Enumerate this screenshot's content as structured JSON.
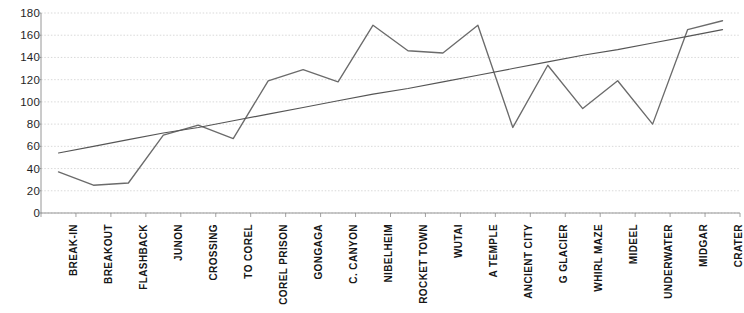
{
  "chart_data": {
    "type": "line",
    "title": "",
    "xlabel": "",
    "ylabel": "",
    "ylim": [
      0,
      180
    ],
    "ytick_step": 20,
    "yticks": [
      180,
      160,
      140,
      120,
      100,
      80,
      60,
      40,
      20,
      0
    ],
    "grid": true,
    "legend": null,
    "categories": [
      "BREAK-IN",
      "BREAKOUT",
      "FLASHBACK",
      "JUNON",
      "CROSSING",
      "TO COREL",
      "COREL PRISON",
      "GONGAGA",
      "C. CANYON",
      "NIBELHEIM",
      "ROCKET TOWN",
      "WUTAI",
      "A TEMPLE",
      "ANCIENT CITY",
      "G GLACIER",
      "WHIRL MAZE",
      "MIDEEL",
      "UNDERWATER",
      "MIDGAR",
      "CRATER"
    ],
    "series": [
      {
        "name": "series-1",
        "type": "line",
        "color": "#6b6b6b",
        "values": [
          37,
          25,
          27,
          70,
          79,
          67,
          119,
          129,
          118,
          169,
          146,
          144,
          169,
          77,
          133,
          94,
          119,
          80,
          165,
          173
        ]
      },
      {
        "name": "trendline",
        "type": "linear-trend",
        "color": "#555555",
        "values": [
          54,
          60,
          66,
          72,
          77,
          83,
          89,
          95,
          101,
          107,
          112,
          118,
          124,
          130,
          136,
          142,
          147,
          153,
          159,
          165
        ]
      }
    ],
    "colors": {
      "series": "#6b6b6b",
      "trendline": "#555555",
      "grid": "#c9c9c9",
      "axis": "#8a8a8a",
      "text": "#1a1a1a",
      "background": "#ffffff"
    }
  },
  "title_sliver": "Average Playing Time"
}
